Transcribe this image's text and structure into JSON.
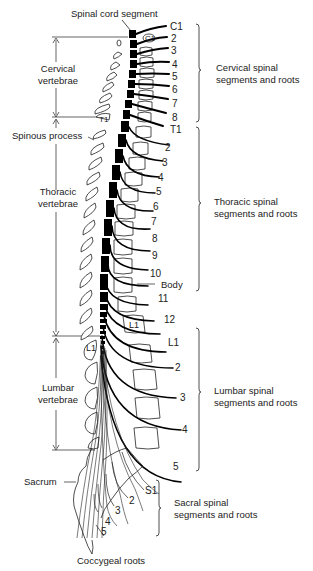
{
  "diagram": {
    "top_label": "Spinal cord segment",
    "left_labels": {
      "cervical_vertebrae": [
        "Cervical",
        "vertebrae"
      ],
      "spinous_process": "Spinous process",
      "thoracic_vertebrae": [
        "Thoracic",
        "vertebrae"
      ],
      "lumbar_vertebrae": [
        "Lumbar",
        "vertebrae"
      ],
      "sacrum": "Sacrum",
      "coccygeal_roots": "Coccygeal roots"
    },
    "vertebra_labels": {
      "c1": "C1",
      "t1": "T1",
      "l1_body": "L1",
      "l1_spinous": "L1"
    },
    "body_label": "Body",
    "right_groups": {
      "cervical": [
        "Cervical spinal",
        "segments and roots"
      ],
      "thoracic": [
        "Thoracic spinal",
        "segments and roots"
      ],
      "lumbar": [
        "Lumbar spinal",
        "segments and roots"
      ],
      "sacral": [
        "Sacral spinal",
        "segments and roots"
      ]
    },
    "root_numbers": {
      "cervical": [
        "C1",
        "2",
        "3",
        "4",
        "5",
        "6",
        "7",
        "8"
      ],
      "thoracic": [
        "T1",
        "2",
        "3",
        "4",
        "5",
        "6",
        "7",
        "8",
        "9",
        "10",
        "11",
        "12"
      ],
      "lumbar": [
        "L1",
        "2",
        "3",
        "4",
        "5"
      ],
      "sacral": [
        "S1",
        "2",
        "3",
        "4",
        "5"
      ]
    },
    "colors": {
      "ink": "#111111",
      "background": "#ffffff"
    }
  }
}
